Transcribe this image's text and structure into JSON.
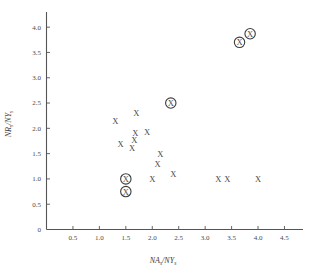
{
  "chart_data": {
    "type": "scatter",
    "title": "",
    "xlabel": "NA/NY",
    "xlabel_main": "NA",
    "xlabel_sub1": "s",
    "xlabel_mid": "/NY",
    "xlabel_sub2": "s",
    "ylabel": "NR/NY",
    "ylabel_main": "NR",
    "ylabel_sub1": "s",
    "ylabel_mid": "/NY",
    "ylabel_sub2": "s",
    "xlim": [
      0,
      4.85
    ],
    "ylim": [
      0,
      4.3
    ],
    "grid": false,
    "legend": "none",
    "xticks": [
      0.5,
      1.0,
      1.5,
      2.0,
      2.5,
      3.0,
      3.5,
      4.0,
      4.5
    ],
    "xtick_labels": [
      "0.5",
      "1.0",
      "1.5",
      "2.0",
      "2.5",
      "3.0",
      "3.5",
      "4.0",
      "4.5"
    ],
    "yticks": [
      0,
      0.5,
      1.0,
      1.5,
      2.0,
      2.5,
      3.0,
      3.5,
      4.0
    ],
    "ytick_labels": [
      "0",
      "0.5",
      "1.0",
      "1.5",
      "2.0",
      "2.5",
      "3.0",
      "3.5",
      "4.0"
    ],
    "origin_label": "0",
    "marker_glyph": "X",
    "series": [
      {
        "name": "plain",
        "marker": "x",
        "circled": false,
        "points": [
          [
            1.3,
            2.15
          ],
          [
            1.7,
            2.3
          ],
          [
            1.4,
            1.7
          ],
          [
            1.68,
            1.9
          ],
          [
            1.9,
            1.92
          ],
          [
            1.66,
            1.76
          ],
          [
            1.62,
            1.62
          ],
          [
            2.15,
            1.5
          ],
          [
            2.1,
            1.3
          ],
          [
            2.0,
            1.0
          ],
          [
            2.4,
            1.1
          ],
          [
            3.25,
            1.0
          ],
          [
            3.42,
            1.0
          ],
          [
            4.0,
            1.0
          ]
        ]
      },
      {
        "name": "circled",
        "marker": "circled-x",
        "circled": true,
        "points": [
          [
            3.65,
            3.7
          ],
          [
            3.85,
            3.87
          ],
          [
            2.35,
            2.5
          ],
          [
            1.5,
            1.0
          ],
          [
            1.5,
            0.75
          ]
        ]
      }
    ]
  }
}
